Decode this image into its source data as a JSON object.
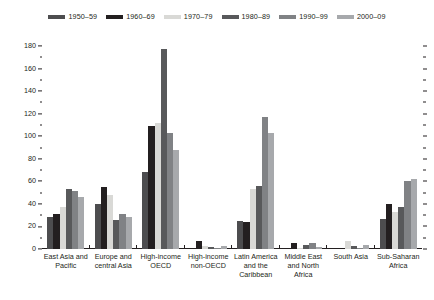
{
  "chart_data": {
    "type": "bar",
    "title": "",
    "subtitle": "",
    "xlabel": "",
    "ylabel": "",
    "ylim": [
      0,
      180
    ],
    "ytick_step": 20,
    "yminor_step": 10,
    "grid": false,
    "legend_position": "top-center",
    "yticks": [
      "0",
      "20",
      "40",
      "60",
      "80",
      "100",
      "120",
      "140",
      "160",
      "180"
    ],
    "categories": [
      "East Asia and Pacific",
      "Europe and central Asia",
      "High-income OECD",
      "High-income non-OECD",
      "Latin America and the Caribbean",
      "Middle East and North Africa",
      "South Asia",
      "Sub-Saharan Africa"
    ],
    "category_lines": [
      [
        "East Asia and",
        "Pacific"
      ],
      [
        "Europe and",
        "central Asia"
      ],
      [
        "High-income",
        "OECD"
      ],
      [
        "High-income",
        "non-OECD"
      ],
      [
        "Latin America",
        "and the",
        "Caribbean"
      ],
      [
        "Middle East",
        "and North",
        "Africa"
      ],
      [
        "South Asia"
      ],
      [
        "Sub-Saharan",
        "Africa"
      ]
    ],
    "series": [
      {
        "name": "1950–59",
        "color": "#4d4d4f",
        "values": [
          28,
          40,
          68,
          0,
          25,
          0,
          0,
          27
        ]
      },
      {
        "name": "1960–69",
        "color": "#231f20",
        "values": [
          31,
          55,
          109,
          7,
          24,
          5,
          0,
          40
        ]
      },
      {
        "name": "1970–79",
        "color": "#d9d9d6",
        "values": [
          37,
          48,
          112,
          3,
          53,
          1,
          7,
          33
        ]
      },
      {
        "name": "1980–89",
        "color": "#58595b",
        "values": [
          53,
          26,
          177,
          2,
          56,
          4,
          3,
          37
        ]
      },
      {
        "name": "1990–99",
        "color": "#808285",
        "values": [
          51,
          31,
          103,
          1,
          117,
          5,
          1,
          60
        ]
      },
      {
        "name": "2000–09",
        "color": "#a7a9ac",
        "values": [
          46,
          28,
          88,
          3,
          103,
          2,
          4,
          62
        ]
      }
    ]
  },
  "legend": {
    "items": [
      {
        "label": "1950–59",
        "color": "#4d4d4f"
      },
      {
        "label": "1960–69",
        "color": "#231f20"
      },
      {
        "label": "1970–79",
        "color": "#d9d9d6"
      },
      {
        "label": "1980–89",
        "color": "#58595b"
      },
      {
        "label": "1990–99",
        "color": "#808285"
      },
      {
        "label": "2000–09",
        "color": "#a7a9ac"
      }
    ]
  }
}
